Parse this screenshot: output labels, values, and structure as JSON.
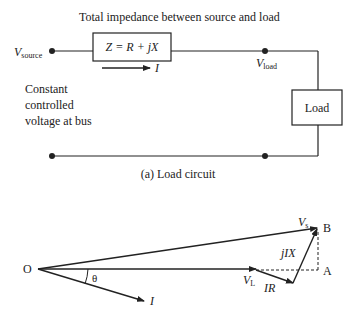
{
  "circuit": {
    "title": "Total impedance between source and load",
    "v_source_main": "V",
    "v_source_sub": "source",
    "impedance_label": "Z = R + jX",
    "current_label": "I",
    "v_load_main": "V",
    "v_load_sub": "load",
    "load_label": "Load",
    "note_lines": [
      "Constant",
      "controlled",
      "voltage at bus"
    ],
    "caption": "(a) Load circuit"
  },
  "phasor": {
    "origin_label": "O",
    "theta_label": "θ",
    "current_label": "I",
    "vs_main": "V",
    "vs_sub": "s",
    "vl_main": "V",
    "vl_sub": "L",
    "ir_label": "IR",
    "jix_label": "jIX",
    "point_a": "A",
    "point_b": "B"
  }
}
